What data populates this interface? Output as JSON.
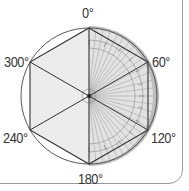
{
  "diagram": {
    "center": [
      89,
      96
    ],
    "radius": 68,
    "angle_labels": [
      {
        "text": "0°",
        "angle": 0
      },
      {
        "text": "60°",
        "angle": 60
      },
      {
        "text": "120°",
        "angle": 120
      },
      {
        "text": "180°",
        "angle": 180
      },
      {
        "text": "240°",
        "angle": 240
      },
      {
        "text": "300°",
        "angle": 300
      }
    ],
    "labels": {
      "a0": "0°",
      "a60": "60°",
      "a120": "120°",
      "a180": "180°",
      "a240": "240°",
      "a300": "300°"
    },
    "colors": {
      "hexagon_fill": "#ebebeb",
      "protractor_rim": "#b8b8b8",
      "protractor_face": "#dcdcdc",
      "line": "#333333",
      "label": "#333333"
    }
  }
}
